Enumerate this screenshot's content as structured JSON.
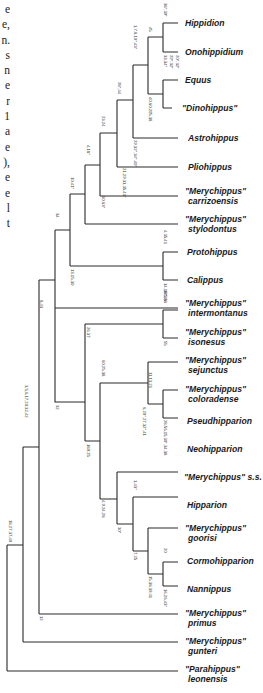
{
  "side_text": {
    "chars": [
      "e",
      "e,",
      "n.",
      "s",
      "n",
      "e",
      "r",
      "1",
      "a",
      "e",
      "),",
      "e",
      "e",
      "l",
      "t"
    ]
  },
  "taxa": [
    {
      "id": "hippidion",
      "line1": "Hippidion",
      "line2": "",
      "quoted": false
    },
    {
      "id": "onohippidium",
      "line1": "Onohippidium",
      "line2": "",
      "quoted": false
    },
    {
      "id": "equus",
      "line1": "Equus",
      "line2": "",
      "quoted": false
    },
    {
      "id": "dinohippus",
      "line1": "\"Dinohippus\"",
      "line2": "",
      "quoted": true
    },
    {
      "id": "astrohippus",
      "line1": "Astrohippus",
      "line2": "",
      "quoted": false
    },
    {
      "id": "pliohippus",
      "line1": "Pliohippus",
      "line2": "",
      "quoted": false
    },
    {
      "id": "merychippus-carrizoensis",
      "line1": "\"Merychippus\"",
      "line2": "carrizoensis",
      "quoted": true
    },
    {
      "id": "merychippus-stylodontus",
      "line1": "\"Merychippus\"",
      "line2": "stylodontus",
      "quoted": true
    },
    {
      "id": "protohippus",
      "line1": "Protohippus",
      "line2": "",
      "quoted": false
    },
    {
      "id": "calippus",
      "line1": "Calippus",
      "line2": "",
      "quoted": false
    },
    {
      "id": "merychippus-intermontanus",
      "line1": "\"Merychippus\"",
      "line2": "intermontanus",
      "quoted": true
    },
    {
      "id": "merychippus-isonesus",
      "line1": "\"Merychippus\"",
      "line2": "isonesus",
      "quoted": true
    },
    {
      "id": "merychippus-sejunctus",
      "line1": "\"Merychippus\"",
      "line2": "sejunctus",
      "quoted": true
    },
    {
      "id": "merychippus-coloradense",
      "line1": "\"Merychippus\"",
      "line2": "coloradense",
      "quoted": true
    },
    {
      "id": "pseudhipparion",
      "line1": "Pseudhipparion",
      "line2": "",
      "quoted": false
    },
    {
      "id": "neohipparion",
      "line1": "Neohipparion",
      "line2": "",
      "quoted": false
    },
    {
      "id": "merychippus-ss",
      "line1": "\"Merychippus\" s.s.",
      "line2": "",
      "quoted": true
    },
    {
      "id": "hipparion",
      "line1": "Hipparion",
      "line2": "",
      "quoted": false
    },
    {
      "id": "merychippus-goorisi",
      "line1": "\"Merychippus\"",
      "line2": "goorisi",
      "quoted": true
    },
    {
      "id": "cormohipparion",
      "line1": "Cormohipparion",
      "line2": "",
      "quoted": false
    },
    {
      "id": "nannippus",
      "line1": "Nannippus",
      "line2": "",
      "quoted": false
    },
    {
      "id": "merychippus-primus",
      "line1": "\"Merychippus\"",
      "line2": "primus",
      "quoted": true
    },
    {
      "id": "merychippus-gunteri",
      "line1": "\"Merychippus\"",
      "line2": "gunteri",
      "quoted": true
    },
    {
      "id": "parahippus-leonensis",
      "line1": "\"Parahippus\"",
      "line2": "leonensis",
      "quoted": true
    }
  ],
  "node_labels": [
    {
      "id": "n-hipp-ono",
      "text": "38*,39*"
    },
    {
      "id": "n-equus-group",
      "text": "45"
    },
    {
      "id": "n-equus-ono",
      "text": "33,34*"
    },
    {
      "id": "n-equus-ono-b",
      "text": "29*,32*"
    },
    {
      "id": "n-equus-ono-c",
      "text": "20*,32*"
    },
    {
      "id": "n-equini",
      "text": "1,7,8,10*,43*"
    },
    {
      "id": "n-dino",
      "text": "40,60,205,38"
    },
    {
      "id": "n-astro",
      "text": "28*,44"
    },
    {
      "id": "n-plio",
      "text": "23,24"
    },
    {
      "id": "n-plio-b",
      "text": "29,32*,34*,40*"
    },
    {
      "id": "n-plio-c",
      "text": "21,29,31,35,43*"
    },
    {
      "id": "n-carr",
      "text": "4,18*"
    },
    {
      "id": "n-carr-b",
      "text": "60,63*"
    },
    {
      "id": "n-styl",
      "text": "10,41*"
    },
    {
      "id": "n-proto-cal",
      "text": "4,35,41"
    },
    {
      "id": "n-proto-cal-b",
      "text": "14,18*,36"
    },
    {
      "id": "n-equinae-a",
      "text": "34"
    },
    {
      "id": "n-equinae-b",
      "text": "13,15,30"
    },
    {
      "id": "n-inter",
      "text": "8,43"
    },
    {
      "id": "n-iso-sej",
      "text": "185,38"
    },
    {
      "id": "n-iso-sej-b",
      "text": "55"
    },
    {
      "id": "n-hipparionini",
      "text": "26,37"
    },
    {
      "id": "n-hipparionini-b",
      "text": "32"
    },
    {
      "id": "n-col",
      "text": "11,13,21"
    },
    {
      "id": "n-col-b",
      "text": "6,20*,27,32*,41"
    },
    {
      "id": "n-pseud-neo",
      "text": "28,56,15,30*,34,38"
    },
    {
      "id": "n-ss",
      "text": "60,25,38"
    },
    {
      "id": "n-ss-b",
      "text": "189,25"
    },
    {
      "id": "n-hipparion",
      "text": "1,43*"
    },
    {
      "id": "n-hipparion-b",
      "text": "4,9,24,28"
    },
    {
      "id": "n-goorisi",
      "text": "30*"
    },
    {
      "id": "n-corm-nann",
      "text": "20"
    },
    {
      "id": "n-corm-nann-b",
      "text": "7,25"
    },
    {
      "id": "n-corm-nann-c",
      "text": "16,26,43*"
    },
    {
      "id": "n-corm-nann-d",
      "text": "15,38,39,41"
    },
    {
      "id": "n-primus",
      "text": "12"
    },
    {
      "id": "n-gunteri",
      "text": "3,5,6,17,20,32,42"
    },
    {
      "id": "n-root",
      "text": "18,27,37,40"
    }
  ]
}
